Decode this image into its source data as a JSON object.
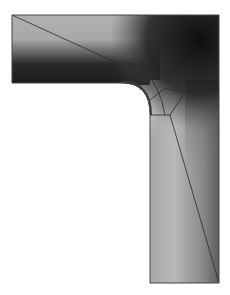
{
  "figure": {
    "colors": {
      "background": "#ffffff",
      "outline": "#333333",
      "mesh_line": "#2a2a2a",
      "light": "#c8c8c8",
      "mid": "#8a8a8a",
      "dark": "#151515"
    }
  }
}
